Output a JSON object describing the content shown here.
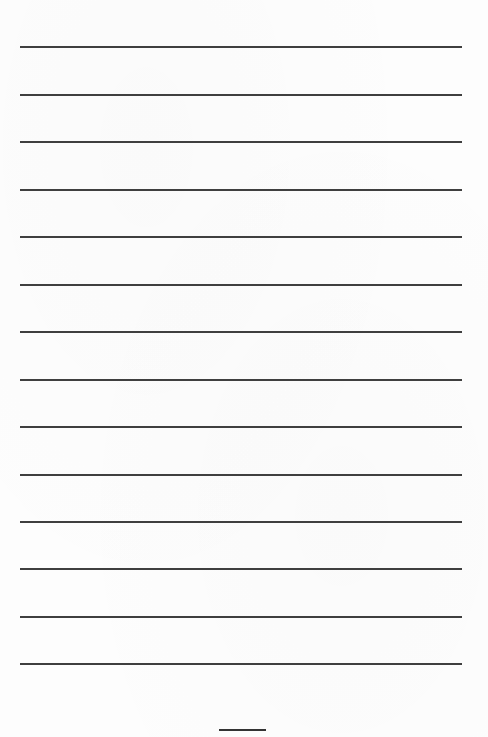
{
  "document": {
    "type": "lined-page",
    "rule_count": 14,
    "rule_positions_y": [
      46,
      94,
      141,
      189,
      236,
      284,
      331,
      379,
      426,
      474,
      521,
      568,
      616,
      663
    ],
    "rule_color": "#2a2a2a",
    "background_color": "#ffffff"
  },
  "footer": {
    "page_number_line": ""
  }
}
